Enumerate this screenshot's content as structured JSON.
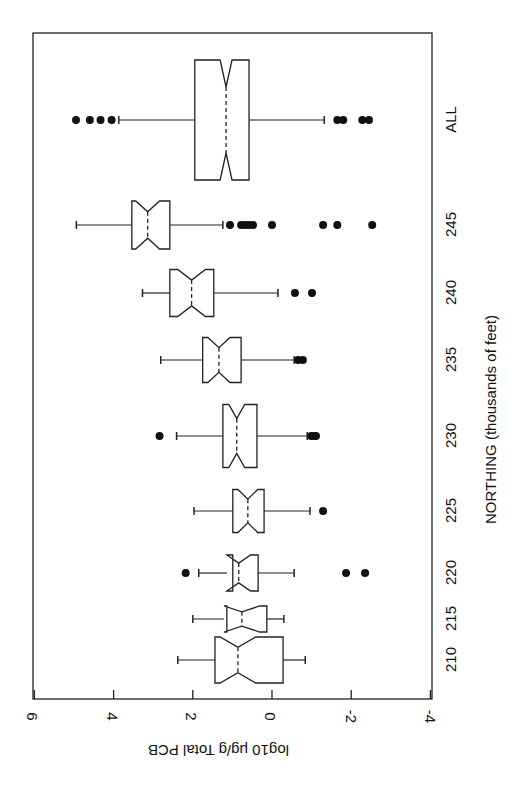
{
  "chart_data": {
    "type": "boxplot",
    "orientation": "horizontal-rotated",
    "title": "",
    "xlabel": "NORTHING (thousands of feet)",
    "ylabel": "log10 μg/g Total PCB",
    "ylim": [
      -4,
      6
    ],
    "y_ticks": [
      6,
      4,
      2,
      0,
      -2,
      -4
    ],
    "y_tick_labels": [
      "6",
      "4",
      "2",
      "0",
      "-2",
      "-4"
    ],
    "grid": false,
    "notched": true,
    "variable_width": true,
    "categories": [
      "210",
      "215",
      "220",
      "225",
      "230",
      "235",
      "240",
      "245",
      "ALL"
    ],
    "groups": [
      {
        "label": "210",
        "lower_whisker": -0.84,
        "q1": -0.28,
        "median": 0.86,
        "q3": 1.44,
        "upper_whisker": 2.38,
        "notch": 0.45,
        "width": 46,
        "outliers": []
      },
      {
        "label": "215",
        "lower_whisker": -0.3,
        "q1": 0.13,
        "median": 0.76,
        "q3": 1.14,
        "upper_whisker": 2.0,
        "notch": 0.45,
        "width": 26,
        "outliers": []
      },
      {
        "label": "220",
        "lower_whisker": -0.56,
        "q1": 0.35,
        "median": 0.84,
        "q3": 0.99,
        "upper_whisker": 1.85,
        "notch": 0.3,
        "width": 36,
        "outliers": [
          2.18,
          -1.87,
          -2.35
        ]
      },
      {
        "label": "225",
        "lower_whisker": -0.96,
        "q1": 0.2,
        "median": 0.61,
        "q3": 0.99,
        "upper_whisker": 1.97,
        "notch": 0.25,
        "width": 43,
        "outliers": [
          -1.29
        ]
      },
      {
        "label": "230",
        "lower_whisker": -0.89,
        "q1": 0.38,
        "median": 0.89,
        "q3": 1.24,
        "upper_whisker": 2.41,
        "notch": 0.2,
        "width": 63,
        "outliers": [
          2.84,
          -0.99,
          -1.06,
          -1.11
        ]
      },
      {
        "label": "235",
        "lower_whisker": -0.56,
        "q1": 0.78,
        "median": 1.34,
        "q3": 1.75,
        "upper_whisker": 2.81,
        "notch": 0.28,
        "width": 45,
        "outliers": [
          -0.66,
          -0.78
        ]
      },
      {
        "label": "240",
        "lower_whisker": -0.15,
        "q1": 1.47,
        "median": 2.03,
        "q3": 2.58,
        "upper_whisker": 3.27,
        "notch": 0.35,
        "width": 47,
        "outliers": [
          -0.58,
          -1.01
        ]
      },
      {
        "label": "245",
        "lower_whisker": 1.24,
        "q1": 2.58,
        "median": 3.14,
        "q3": 3.54,
        "upper_whisker": 4.94,
        "notch": 0.3,
        "width": 48,
        "outliers": [
          1.06,
          0.78,
          0.68,
          0.58,
          0.48,
          0.0,
          -1.29,
          -1.65,
          -2.53
        ]
      },
      {
        "label": "ALL",
        "lower_whisker": -1.32,
        "q1": 0.58,
        "median": 1.16,
        "q3": 1.95,
        "upper_whisker": 3.87,
        "notch": 0.15,
        "width": 120,
        "outliers": [
          4.05,
          4.33,
          4.6,
          4.95,
          -1.65,
          -1.8,
          -2.28,
          -2.45
        ]
      }
    ]
  },
  "layout": {
    "frame": {
      "left": 33,
      "top": 33,
      "right": 432,
      "bottom": 699
    },
    "value_to_x": {
      "zero_x": 272,
      "px_per_unit": 39.6
    },
    "group_centers_y": [
      660,
      619,
      573,
      511,
      436,
      360,
      293,
      225,
      120
    ]
  },
  "labels": {
    "x_axis_title": "NORTHING (thousands of feet)",
    "y_axis_title": "log10 μg/g Total PCB"
  }
}
